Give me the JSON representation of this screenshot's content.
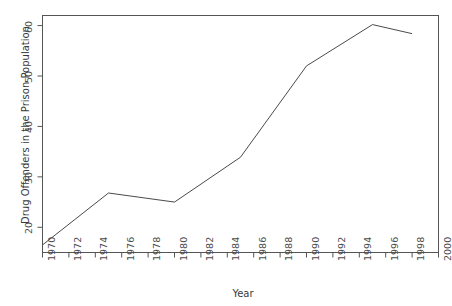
{
  "figure": {
    "title_ghost": "",
    "background_color": "#ffffff",
    "frame_color": "#555555",
    "line_color": "#4a4a4a",
    "text_color": "#3a3a3a"
  },
  "chart_data": {
    "type": "line",
    "title": "",
    "xlabel": "Year",
    "ylabel": "Drug Offenders in the Prison Population",
    "xlim": [
      1970,
      2000
    ],
    "ylim": [
      15,
      62
    ],
    "grid": false,
    "legend": "none",
    "xticks": [
      1970,
      1972,
      1974,
      1976,
      1978,
      1980,
      1982,
      1984,
      1986,
      1988,
      1990,
      1992,
      1994,
      1996,
      1998,
      2000
    ],
    "xtick_labels": [
      "1970",
      "1972",
      "1974",
      "1976",
      "1978",
      "1980",
      "1982",
      "1984",
      "1986",
      "1988",
      "1990",
      "1992",
      "1994",
      "1996",
      "1998",
      "2000"
    ],
    "yticks": [
      20,
      30,
      40,
      50,
      60
    ],
    "ytick_labels": [
      "20",
      "30",
      "40",
      "50",
      "60"
    ],
    "x": [
      1970,
      1975,
      1980,
      1985,
      1990,
      1995,
      1998
    ],
    "values": [
      16.5,
      26.8,
      25.0,
      33.9,
      52.0,
      60.2,
      58.4
    ],
    "series": [
      {
        "name": "Drug Offenders in the Prison Population",
        "x": [
          1970,
          1975,
          1980,
          1985,
          1990,
          1995,
          1998
        ],
        "values": [
          16.5,
          26.8,
          25.0,
          33.9,
          52.0,
          60.2,
          58.4
        ]
      }
    ]
  }
}
